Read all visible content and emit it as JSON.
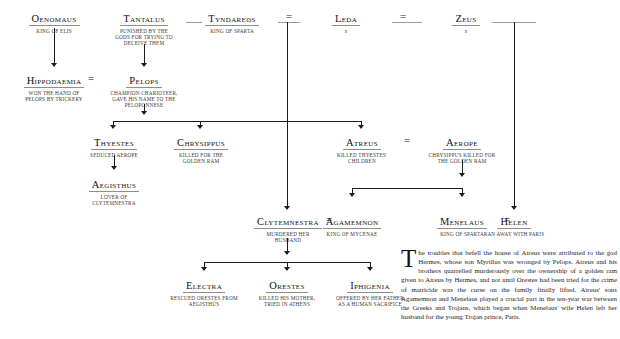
{
  "symbols": {
    "marriage": "="
  },
  "nodes": [
    {
      "id": "oenomaus",
      "name": "Oenomaus",
      "desc": "KING OF ELIS"
    },
    {
      "id": "tantalus",
      "name": "Tantalus",
      "desc": "PUNISHED BY THE\nGODS FOR TRYING TO\nDECEIVE THEM"
    },
    {
      "id": "tyndareos",
      "name": "Tyndareos",
      "desc": "KING OF SPARTA"
    },
    {
      "id": "leda",
      "name": "Leda",
      "desc": "x"
    },
    {
      "id": "zeus",
      "name": "Zeus",
      "desc": "x"
    },
    {
      "id": "hippodaemia",
      "name": "Hippodaemia",
      "desc": "WON THE HAND OF\nPELOPS BY TRICKERY"
    },
    {
      "id": "pelops",
      "name": "Pelops",
      "desc": "CHAMPION CHARIOTEER,\nGAVE HIS NAME TO THE\nPELOPONNESE"
    },
    {
      "id": "thyestes",
      "name": "Thyestes",
      "desc": "SEDUCED AEROPE"
    },
    {
      "id": "chrysippus",
      "name": "Chrysippus",
      "desc": "KILLED FOR THE\nGOLDEN RAM"
    },
    {
      "id": "atreus",
      "name": "Atreus",
      "desc": "KILLED THYESTES'\nCHILDREN"
    },
    {
      "id": "aerope",
      "name": "Aerope",
      "desc": "CHRYSIPPUS KILLED FOR\nTHE GOLDEN RAM"
    },
    {
      "id": "aegisthus",
      "name": "Aegisthus",
      "desc": "LOVER OF\nCLYTEMNESTRA"
    },
    {
      "id": "clytemnestra",
      "name": "Clytemnestra",
      "desc": "MURDERED HER\nHUSBAND"
    },
    {
      "id": "agamemnon",
      "name": "Agamemnon",
      "desc": "KING OF MYCENAE"
    },
    {
      "id": "menelaus",
      "name": "Menelaus",
      "desc": "KING OF SPARTA"
    },
    {
      "id": "helen",
      "name": "Helen",
      "desc": "RAN AWAY WITH PARIS"
    },
    {
      "id": "electra",
      "name": "Electra",
      "desc": "RESCUED ORESTES FROM\nAEGISTHUS"
    },
    {
      "id": "orestes",
      "name": "Orestes",
      "desc": "KILLED HIS MOTHER,\nTRIED IN ATHENS"
    },
    {
      "id": "iphigenia",
      "name": "Iphigenia",
      "desc": "OFFERED BY HER FATHER\nAS A HUMAN SACRIFICE"
    }
  ],
  "prose": {
    "dropcap": "T",
    "body": "he troubles that befell the house of Atreus were attributed to the god Hermes, whose son Myrtilus was wronged by Pelops. Atreus and his brothers quarrelled murderously over the ownership of a golden ram given to Atreus by Hermes, and not until Orestes had been tried for the crime of matricide was the curse on the family finally lifted. Atreus' sons Agamemnon and Menelaus played a crucial part in the ten-year war between the Greeks and Trojans, which began when Menelaus' wife Helen left her husband for the young Trojan prince, Paris."
  }
}
